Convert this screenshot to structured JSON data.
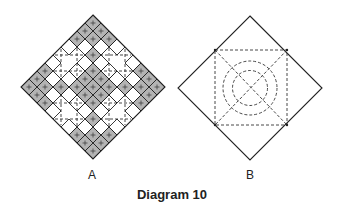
{
  "caption": "Diagram 10",
  "colors": {
    "line": "#222222",
    "shade": "#b3b3b3",
    "dash": "#333333",
    "background": "#ffffff"
  },
  "diagrams": [
    {
      "id": "A",
      "label": "A",
      "description": "Square rotated 45 degrees, divided into 9x9 grid; shaded cells form full central horizontal and vertical bands plus X-shaped clusters at the four tips; each shaded cell has a small cross mark; dashed axis-aligned squares in the four white quadrant regions",
      "center": [
        93,
        87
      ],
      "half_diagonal": 72,
      "grid_size": 9,
      "shaded_cells_rc": [
        [
          0,
          0
        ],
        [
          1,
          1
        ],
        [
          2,
          2
        ],
        [
          3,
          3
        ],
        [
          4,
          4
        ],
        [
          5,
          5
        ],
        [
          6,
          6
        ],
        [
          7,
          7
        ],
        [
          8,
          8
        ],
        [
          8,
          0
        ],
        [
          7,
          1
        ],
        [
          6,
          2
        ],
        [
          5,
          3
        ],
        [
          3,
          5
        ],
        [
          2,
          6
        ],
        [
          1,
          7
        ],
        [
          0,
          8
        ],
        [
          2,
          0
        ],
        [
          0,
          2
        ],
        [
          1,
          0
        ],
        [
          0,
          1
        ],
        [
          6,
          0
        ],
        [
          7,
          0
        ],
        [
          8,
          1
        ],
        [
          8,
          2
        ],
        [
          0,
          6
        ],
        [
          0,
          7
        ],
        [
          1,
          8
        ],
        [
          2,
          8
        ],
        [
          8,
          6
        ],
        [
          8,
          7
        ],
        [
          6,
          8
        ],
        [
          7,
          8
        ],
        [
          3,
          4
        ],
        [
          4,
          3
        ],
        [
          4,
          5
        ],
        [
          5,
          4
        ]
      ],
      "dashed_h_lines_y": [
        55,
        71,
        103,
        119
      ],
      "dashed_v_lines_x": [
        61,
        77,
        109,
        125
      ]
    },
    {
      "id": "B",
      "label": "B",
      "description": "Square rotated 45 degrees with inscribed dashed axis-aligned square, dashed diagonals, and two concentric dashed circles",
      "center": [
        250,
        88
      ],
      "half_diagonal": 72,
      "inner_square": [
        215,
        50,
        287,
        125
      ],
      "circle_radii": [
        27,
        17.5
      ]
    }
  ]
}
